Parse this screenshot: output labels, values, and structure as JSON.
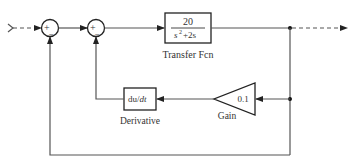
{
  "diagram": {
    "type": "simulink-block-diagram",
    "blocks": {
      "sum1": {
        "signs": [
          "+",
          "−"
        ],
        "plus_label": "+",
        "minus_label": "−"
      },
      "sum2": {
        "signs": [
          "+",
          "−"
        ],
        "plus_label": "+",
        "minus_label": "−"
      },
      "transfer_fcn": {
        "numerator": "20",
        "denominator_base": "s",
        "denominator_exp": "2",
        "denominator_rest": "+2s",
        "name": "Transfer Fcn"
      },
      "gain": {
        "value": "0.1",
        "name": "Gain"
      },
      "derivative": {
        "expr_du": "du",
        "expr_slash": "/",
        "expr_dt": "dt",
        "name": "Derivative"
      }
    },
    "connections": [
      {
        "from": "input",
        "to": "sum1.plus",
        "style": "dashed"
      },
      {
        "from": "sum1",
        "to": "sum2.plus"
      },
      {
        "from": "sum2",
        "to": "transfer_fcn"
      },
      {
        "from": "transfer_fcn",
        "to": "output",
        "style": "dashed"
      },
      {
        "from": "transfer_fcn.output",
        "to": "gain"
      },
      {
        "from": "gain",
        "to": "derivative"
      },
      {
        "from": "derivative",
        "to": "sum2.minus"
      },
      {
        "from": "transfer_fcn.output",
        "to": "sum1.minus"
      }
    ],
    "colors": {
      "line": "#555555",
      "block_border": "#222222",
      "text": "#333333",
      "background": "#ffffff"
    }
  }
}
